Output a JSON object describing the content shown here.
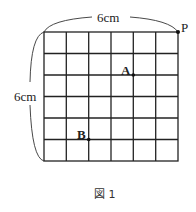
{
  "figure": {
    "top_dimension": "6cm",
    "left_dimension": "6cm",
    "points": {
      "P": "P",
      "A": "A",
      "B": "B"
    },
    "caption": "図 1",
    "grid": {
      "columns": 6,
      "rows": 6
    },
    "line_color": "#222222"
  }
}
